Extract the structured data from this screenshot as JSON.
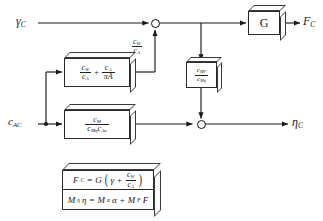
{
  "diagram": {
    "inputs": [
      {
        "name": "gamma-c",
        "symbol": "γ",
        "sub": "C"
      },
      {
        "name": "c-ac",
        "symbol": "c",
        "sub": "AC"
      }
    ],
    "outputs": [
      {
        "name": "f-c",
        "symbol": "F",
        "sub": "C"
      },
      {
        "name": "eta-c",
        "symbol": "η",
        "sub": "C"
      }
    ],
    "blocks": {
      "gain_g": {
        "label": "G"
      },
      "aero_sum": {
        "num1": "c",
        "num1sub": "W",
        "den1": "c",
        "den1sub": "A",
        "op": "+",
        "num2": "c",
        "num2sub": "A",
        "den2": "πA"
      },
      "moment_ratio": {
        "num": "c",
        "numsub": "M",
        "den1": "c",
        "den1sub": "Mη",
        "den2": "c",
        "den2sub": "Aα"
      },
      "feedback": {
        "num": "c",
        "numsub": "MF",
        "den": "c",
        "densub": "Mη"
      }
    },
    "signal_labels": [
      {
        "name": "cw-over-ca",
        "num": "c",
        "numsub": "W",
        "den": "c",
        "densub": "A"
      }
    ],
    "equations": {
      "eq1": {
        "lhs": "F",
        "lhssub": "C",
        "eq": "=",
        "gain": "G",
        "open": "(",
        "term1": "γ",
        "plus": "+",
        "num": "c",
        "numsub": "W",
        "den": "c",
        "densub": "A",
        "close": ")"
      },
      "eq2": {
        "m1": "M",
        "m1sub": "η",
        "v1": "η",
        "eq": "=",
        "m2": "M",
        "m2sub": "α",
        "v2": "α",
        "plus": "+",
        "m3": "M",
        "m3sub": "F",
        "v3": "F"
      }
    },
    "junctions": [
      {
        "name": "summing-junction-top"
      },
      {
        "name": "summing-junction-bottom"
      }
    ],
    "colors": {
      "line": "#1a1a1a",
      "box_fill": "#ffffff",
      "box_top": "#fbfbfb",
      "background": "#ffffff"
    }
  }
}
